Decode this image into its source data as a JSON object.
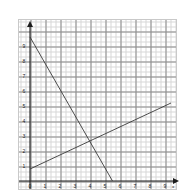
{
  "chart_data": {
    "type": "line",
    "title": "",
    "subtitle": "",
    "xlabel": "x",
    "ylabel": "y",
    "xlim": [
      0,
      9.8
    ],
    "ylim": [
      0,
      9.8
    ],
    "grid": true,
    "minor_grid": true,
    "legend": "none",
    "x_ticks": [
      "0",
      "1",
      "2",
      "3",
      "4",
      "5",
      "6",
      "7",
      "8",
      "9"
    ],
    "x_tick_values": [
      0,
      1,
      2,
      3,
      4,
      5,
      6,
      7,
      8,
      9
    ],
    "y_ticks": [
      "1",
      "2",
      "3",
      "4",
      "5",
      "6",
      "7",
      "8",
      "9"
    ],
    "y_tick_values": [
      1,
      2,
      3,
      4,
      5,
      6,
      7,
      8,
      9
    ],
    "origin_label": "0",
    "series": [
      {
        "name": "descending-line",
        "points": [
          [
            0,
            9.6
          ],
          [
            5.5,
            0
          ]
        ],
        "slope": -1.75,
        "intercept": 9.6,
        "color": "#3a3a3a"
      },
      {
        "name": "ascending-line",
        "points": [
          [
            0,
            0.8
          ],
          [
            9.4,
            5.2
          ]
        ],
        "slope": 0.47,
        "intercept": 0.8,
        "color": "#3a3a3a"
      }
    ],
    "intersection": [
      4.2,
      2.75
    ],
    "annotations": []
  },
  "graph": {
    "axis_color": "#1d1d1d",
    "grid_minor_color": "#d6d6d6",
    "grid_major_color": "#8c8c8c",
    "frame_color": "#c9c9c9",
    "background": "#ffffff",
    "x_axis_name": "x",
    "y_axis_name": "y"
  }
}
